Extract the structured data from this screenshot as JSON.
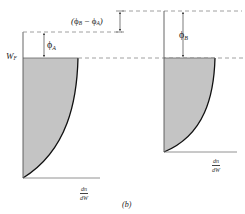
{
  "figure": {
    "caption": "(b)",
    "colors": {
      "fill": "#c4c4c4",
      "axis": "#555555",
      "curve": "#111111",
      "dashed": "#888888"
    },
    "left_panel": {
      "fermi_level_label": "W",
      "fermi_level_sub": "F",
      "work_function_label": "ϕ",
      "work_function_sub": "A",
      "x_axis_label_num": "dn",
      "x_axis_label_den": "dW"
    },
    "right_panel": {
      "work_function_label": "ϕ",
      "work_function_sub": "B",
      "x_axis_label_num": "dn",
      "x_axis_label_den": "dW"
    },
    "difference_label": {
      "open": "(",
      "phi_b": "ϕ",
      "sub_b": "B",
      "minus": " − ",
      "phi_a": "ϕ",
      "sub_a": "A",
      "close": ")"
    }
  }
}
